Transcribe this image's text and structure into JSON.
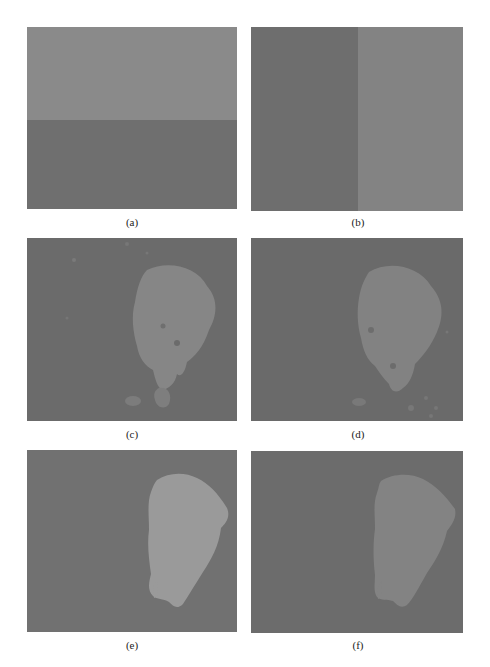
{
  "figure": {
    "panels": [
      {
        "id": "a",
        "label": "(a)",
        "description": "two-region image split horizontally: lighter top, darker bottom",
        "colors": {
          "top": "#8a8a8a",
          "bottom": "#6f6f6f"
        }
      },
      {
        "id": "b",
        "label": "(b)",
        "description": "two-region image split vertically: darker left, lighter right",
        "colors": {
          "left": "#6e6e6e",
          "right": "#838383"
        }
      },
      {
        "id": "c",
        "label": "(c)",
        "description": "segmentation result with irregular blob and noise specks",
        "colors": {
          "background": "#6b6b6b",
          "blob": "#868686"
        }
      },
      {
        "id": "d",
        "label": "(d)",
        "description": "segmentation result with irregular blob and scattered specks",
        "colors": {
          "background": "#6a6a6a",
          "blob": "#828282"
        }
      },
      {
        "id": "e",
        "label": "(e)",
        "description": "clean segmentation with smooth teardrop-shaped bright region",
        "colors": {
          "background": "#717171",
          "blob": "#9a9a9a"
        }
      },
      {
        "id": "f",
        "label": "(f)",
        "description": "clean segmentation with smooth teardrop-shaped region",
        "colors": {
          "background": "#6c6c6c",
          "blob": "#838383"
        }
      }
    ]
  }
}
